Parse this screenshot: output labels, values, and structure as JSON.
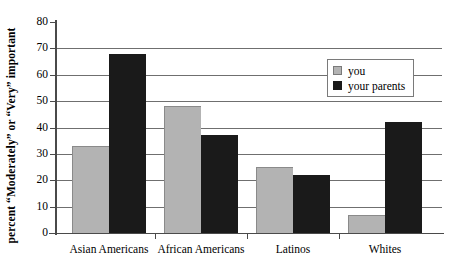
{
  "chart_data": {
    "type": "bar",
    "title": "",
    "xlabel": "",
    "ylabel": "percent “Moderately” or “Very” important",
    "ylim": [
      0,
      80
    ],
    "yticks": [
      0,
      10,
      20,
      30,
      40,
      50,
      60,
      70,
      80
    ],
    "ytick_labels": [
      "0",
      "10",
      "20",
      "30",
      "40",
      "50",
      "60",
      "70",
      "80"
    ],
    "grid": "horizontal",
    "legend_position": "upper-right-inside",
    "categories": [
      "Asian Americans",
      "African Americans",
      "Latinos",
      "Whites"
    ],
    "series": [
      {
        "name": "you",
        "color": "#b3b3b3",
        "values": [
          33,
          48,
          25,
          7
        ]
      },
      {
        "name": "your parents",
        "color": "#1a1a1a",
        "values": [
          68,
          37,
          22,
          42
        ]
      }
    ]
  },
  "legend": {
    "entries": [
      {
        "label": "you",
        "swatch": "you"
      },
      {
        "label": "your parents",
        "swatch": "parents"
      }
    ]
  }
}
